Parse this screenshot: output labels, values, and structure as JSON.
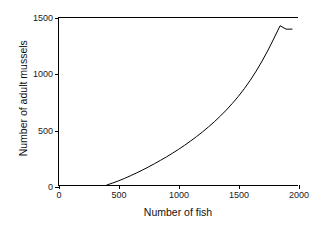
{
  "chart_data": {
    "type": "line",
    "title": "",
    "xlabel": "Number of fish",
    "ylabel": "Number of adult mussels",
    "xlim": [
      0,
      2000
    ],
    "ylim": [
      0,
      1500
    ],
    "xticks": [
      0,
      500,
      1000,
      1500,
      2000
    ],
    "yticks": [
      0,
      500,
      1000,
      1500
    ],
    "xtick_labels": [
      "0",
      "500",
      "1000",
      "1500",
      "2000"
    ],
    "ytick_labels": [
      "0",
      "500",
      "1000",
      "1500"
    ],
    "grid": false,
    "legend": false,
    "legend_position": "none",
    "line_color": "#000000",
    "line_width": 1,
    "background_color": "#ffffff",
    "axis_color": "#000000",
    "series": [
      {
        "name": "adult mussels vs fish",
        "x": [
          400,
          450,
          500,
          550,
          600,
          650,
          700,
          750,
          800,
          850,
          900,
          950,
          1000,
          1050,
          1100,
          1150,
          1200,
          1250,
          1300,
          1350,
          1400,
          1450,
          1500,
          1550,
          1600,
          1650,
          1700,
          1750,
          1800,
          1850,
          1900,
          1950
        ],
        "y": [
          0,
          18,
          38,
          60,
          84,
          109,
          135,
          163,
          192,
          222,
          253,
          286,
          320,
          356,
          394,
          434,
          476,
          521,
          568,
          619,
          673,
          732,
          795,
          864,
          940,
          1023,
          1114,
          1213,
          1320,
          1430,
          1400,
          1400
        ]
      }
    ]
  },
  "axes": {
    "x_ticks": [
      {
        "value": 0,
        "label": "0"
      },
      {
        "value": 500,
        "label": "500"
      },
      {
        "value": 1000,
        "label": "1000"
      },
      {
        "value": 1500,
        "label": "1500"
      },
      {
        "value": 2000,
        "label": "2000"
      }
    ],
    "y_ticks": [
      {
        "value": 0,
        "label": "0"
      },
      {
        "value": 500,
        "label": "500"
      },
      {
        "value": 1000,
        "label": "1000"
      },
      {
        "value": 1500,
        "label": "1500"
      }
    ]
  }
}
